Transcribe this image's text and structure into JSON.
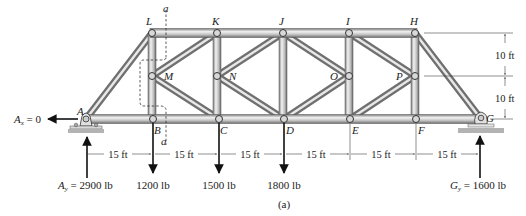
{
  "figure": {
    "caption": "(a)",
    "section_label": "a",
    "nodes": {
      "A": "A",
      "B": "B",
      "C": "C",
      "D": "D",
      "E": "E",
      "F": "F",
      "G": "G",
      "H": "H",
      "I": "I",
      "J": "J",
      "K": "K",
      "L": "L",
      "M": "M",
      "N": "N",
      "O": "O",
      "P": "P"
    },
    "reactions": {
      "Ax": "A",
      "Ax_sub": "x",
      "Ax_val": " = 0",
      "Ay": "A",
      "Ay_sub": "y",
      "Ay_val": " = 2900 lb",
      "Gy": "G",
      "Gy_sub": "y",
      "Gy_val": " = 1600 lb"
    },
    "loads": [
      {
        "node": "B",
        "label": "1200 lb"
      },
      {
        "node": "C",
        "label": "1500 lb"
      },
      {
        "node": "D",
        "label": "1800 lb"
      }
    ],
    "horizontal_dims": [
      "15 ft",
      "15 ft",
      "15 ft",
      "15 ft",
      "15 ft",
      "15 ft"
    ],
    "vertical_dims": [
      "10 ft",
      "10 ft"
    ],
    "colors": {
      "member_light": "#e6e6e6",
      "member_dark": "#8a8a8a",
      "ground": "#b3b3b3",
      "ink": "#111111"
    }
  }
}
